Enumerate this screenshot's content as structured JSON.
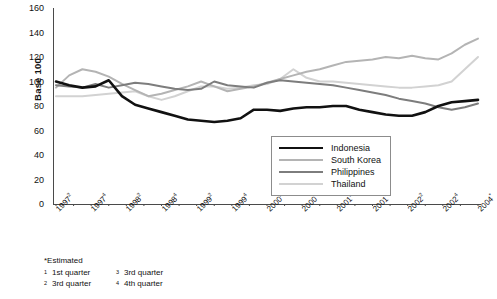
{
  "chart_data": {
    "type": "line",
    "title": "",
    "xlabel": "",
    "ylabel": "Base 100",
    "ylim": [
      0,
      160
    ],
    "ytick_values": [
      160,
      140,
      120,
      100,
      80,
      60,
      40,
      20,
      0
    ],
    "grid": false,
    "legend_position": "inside-bottom-right",
    "x_tick_labels": [
      "1997²",
      "",
      "1997⁴",
      "",
      "1998²",
      "",
      "1998⁴",
      "",
      "1999²",
      "",
      "1999⁴",
      "",
      "2000²",
      "",
      "2000⁴",
      "",
      "2001²",
      "",
      "2001⁴",
      "",
      "2002²",
      "",
      "2002⁴",
      "",
      "2004*"
    ],
    "x_labels_display": [
      {
        "text": "1997",
        "sup": "2"
      },
      {
        "text": "1997",
        "sup": "4"
      },
      {
        "text": "1998",
        "sup": "2"
      },
      {
        "text": "1998",
        "sup": "4"
      },
      {
        "text": "1999",
        "sup": "2"
      },
      {
        "text": "1999",
        "sup": "4"
      },
      {
        "text": "2000",
        "sup": "2"
      },
      {
        "text": "2000",
        "sup": "4"
      },
      {
        "text": "2001",
        "sup": "2"
      },
      {
        "text": "2001",
        "sup": "4"
      },
      {
        "text": "2002",
        "sup": "2"
      },
      {
        "text": "2002",
        "sup": "4"
      },
      {
        "text": "2004",
        "sup": "*"
      }
    ],
    "series": [
      {
        "name": "Indonesia",
        "color": "#111111",
        "width": 2.6,
        "values": [
          100,
          97,
          95,
          96,
          101,
          88,
          81,
          78,
          75,
          72,
          69,
          68,
          67,
          68,
          70,
          77,
          77,
          76,
          78,
          79,
          79,
          80,
          80,
          77,
          75,
          73,
          72,
          72,
          75,
          80,
          83,
          84,
          85
        ]
      },
      {
        "name": "South Korea",
        "color": "#b4b4b4",
        "width": 2.0,
        "values": [
          95,
          105,
          110,
          108,
          104,
          98,
          93,
          88,
          90,
          93,
          96,
          100,
          96,
          92,
          94,
          96,
          99,
          102,
          105,
          108,
          110,
          113,
          116,
          117,
          118,
          120,
          119,
          121,
          119,
          118,
          123,
          130,
          135
        ]
      },
      {
        "name": "Philippines",
        "color": "#7d7d7d",
        "width": 2.0,
        "values": [
          97,
          96,
          95,
          98,
          95,
          97,
          99,
          98,
          96,
          94,
          93,
          94,
          100,
          97,
          96,
          95,
          99,
          101,
          100,
          99,
          98,
          97,
          95,
          93,
          91,
          89,
          86,
          84,
          82,
          79,
          77,
          79,
          82
        ]
      },
      {
        "name": "Thailand",
        "color": "#d2d2d2",
        "width": 2.0,
        "values": [
          88,
          88,
          88,
          89,
          90,
          91,
          92,
          88,
          85,
          88,
          92,
          96,
          96,
          94,
          95,
          97,
          98,
          102,
          110,
          103,
          100,
          100,
          99,
          98,
          97,
          96,
          95,
          95,
          96,
          97,
          100,
          110,
          120
        ]
      }
    ]
  },
  "legend": {
    "items": [
      {
        "label": "Indonesia"
      },
      {
        "label": "South Korea"
      },
      {
        "label": "Philippines"
      },
      {
        "label": "Thailand"
      }
    ]
  },
  "footnotes": {
    "estimated": "*Estimated",
    "entries": [
      {
        "marker": "1",
        "text": "1st quarter"
      },
      {
        "marker": "3",
        "text": "3rd quarter"
      },
      {
        "marker": "2",
        "text": "3rd quarter"
      },
      {
        "marker": "4",
        "text": "4th quarter"
      }
    ]
  }
}
